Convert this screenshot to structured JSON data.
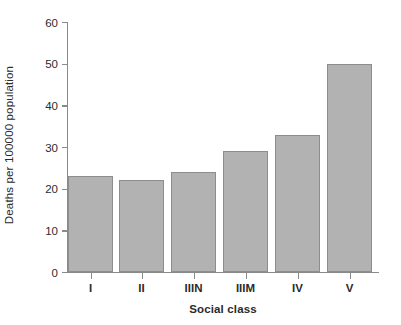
{
  "chart_data": {
    "type": "bar",
    "title": "",
    "xlabel": "Social class",
    "ylabel": "Deaths per 100000 population",
    "categories": [
      "I",
      "II",
      "IIIN",
      "IIIM",
      "IV",
      "V"
    ],
    "values": [
      23,
      22,
      24,
      29,
      33,
      50
    ],
    "ylim": [
      0,
      60
    ],
    "yticks": [
      0,
      10,
      20,
      30,
      40,
      50,
      60
    ],
    "ytick_labels": [
      "0",
      "10",
      "20",
      "30",
      "40",
      "50",
      "60"
    ],
    "grid": false,
    "legend": null,
    "series": [
      {
        "name": "Deaths per 100000 population",
        "values": [
          23,
          22,
          24,
          29,
          33,
          50
        ]
      }
    ],
    "colors": {
      "bar_fill": "#b2b2b2",
      "bar_edge": "#8d8d8d",
      "axis": "#8a8a8a",
      "text": "#2b2b2b",
      "background": "#ffffff"
    }
  }
}
